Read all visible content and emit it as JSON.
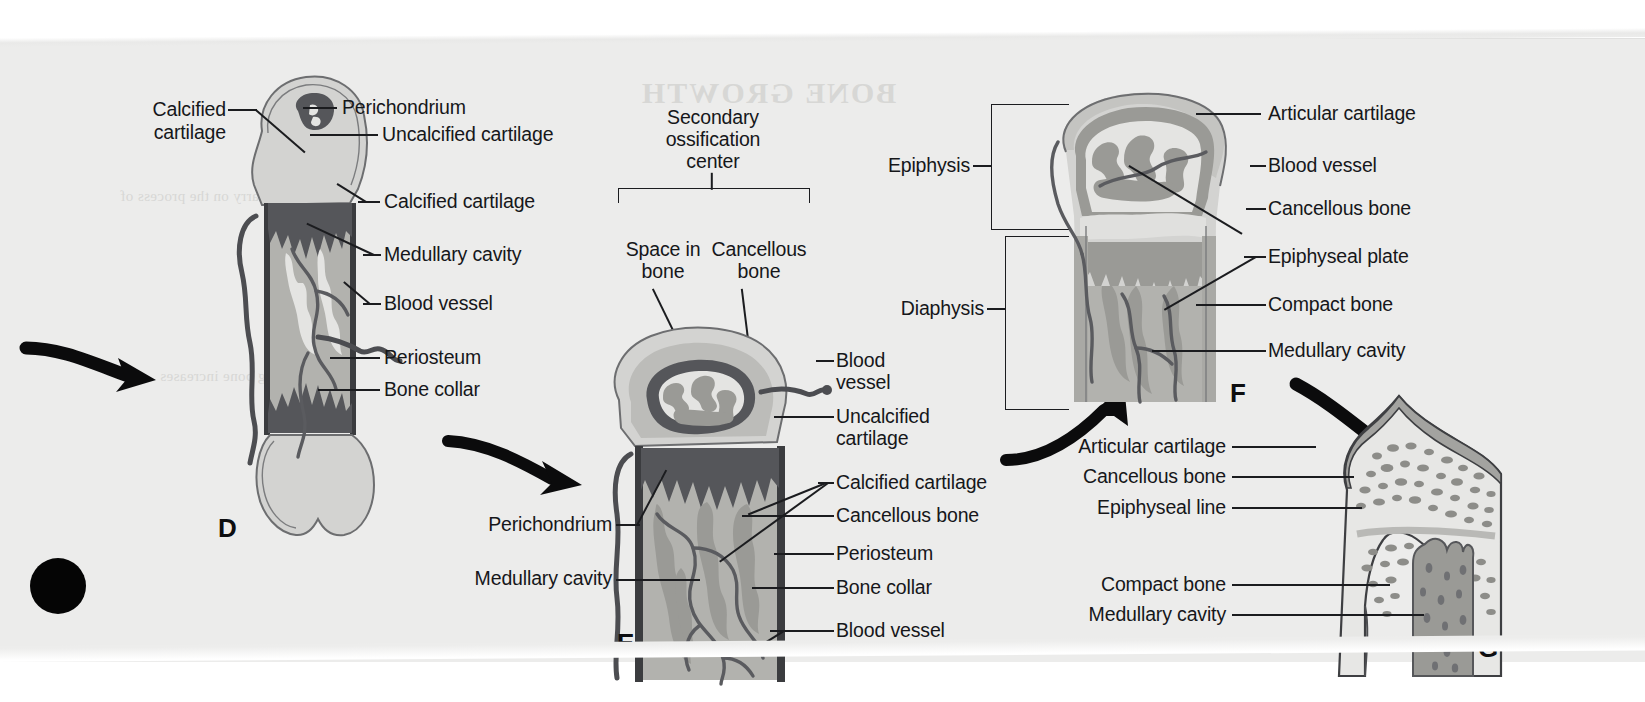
{
  "figure": {
    "background_color": "#ececeb",
    "ink_color": "#16171a"
  },
  "panels": [
    {
      "id": "D",
      "letter": "D",
      "labels": [
        {
          "name": "calcified-cartilage",
          "text": "Calcified\ncartilage"
        },
        {
          "name": "perichondrium",
          "text": "Perichondrium"
        },
        {
          "name": "uncalcified-cartilage",
          "text": "Uncalcified cartilage"
        },
        {
          "name": "calcified-cartilage-2",
          "text": "Calcified cartilage"
        },
        {
          "name": "medullary-cavity",
          "text": "Medullary cavity"
        },
        {
          "name": "blood-vessel",
          "text": "Blood vessel"
        },
        {
          "name": "periosteum",
          "text": "Periosteum"
        },
        {
          "name": "bone-collar",
          "text": "Bone collar"
        }
      ]
    },
    {
      "id": "E",
      "letter": "E",
      "bracket_title": "Secondary\nossification\ncenter",
      "labels": [
        {
          "name": "space-in-bone",
          "text": "Space in\nbone"
        },
        {
          "name": "cancellous-bone-top",
          "text": "Cancellous\nbone"
        },
        {
          "name": "blood-vessel-top",
          "text": "Blood\nvessel"
        },
        {
          "name": "uncalcified-cartilage",
          "text": "Uncalcified\ncartilage"
        },
        {
          "name": "calcified-cartilage",
          "text": "Calcified cartilage"
        },
        {
          "name": "cancellous-bone",
          "text": "Cancellous bone"
        },
        {
          "name": "periosteum",
          "text": "Periosteum"
        },
        {
          "name": "bone-collar",
          "text": "Bone collar"
        },
        {
          "name": "blood-vessel-bottom",
          "text": "Blood vessel"
        },
        {
          "name": "perichondrium",
          "text": "Perichondrium"
        },
        {
          "name": "medullary-cavity",
          "text": "Medullary cavity"
        }
      ]
    },
    {
      "id": "F",
      "letter": "F",
      "labels": [
        {
          "name": "epiphysis",
          "text": "Epiphysis"
        },
        {
          "name": "diaphysis",
          "text": "Diaphysis"
        },
        {
          "name": "articular-cartilage",
          "text": "Articular cartilage"
        },
        {
          "name": "blood-vessel",
          "text": "Blood vessel"
        },
        {
          "name": "cancellous-bone",
          "text": "Cancellous bone"
        },
        {
          "name": "epiphyseal-plate",
          "text": "Epiphyseal plate"
        },
        {
          "name": "compact-bone",
          "text": "Compact bone"
        },
        {
          "name": "medullary-cavity",
          "text": "Medullary cavity"
        }
      ]
    },
    {
      "id": "G",
      "letter": "G",
      "labels": [
        {
          "name": "articular-cartilage",
          "text": "Articular cartilage"
        },
        {
          "name": "cancellous-bone",
          "text": "Cancellous bone"
        },
        {
          "name": "epiphyseal-line",
          "text": "Epiphyseal line"
        },
        {
          "name": "compact-bone",
          "text": "Compact bone"
        },
        {
          "name": "medullary-cavity",
          "text": "Medullary cavity"
        }
      ]
    }
  ],
  "panel_d": {
    "letter": "D",
    "l_calcified_cartilage": "Calcified",
    "l_calcified_cartilage2": "cartilage",
    "l_perichondrium": "Perichondrium",
    "l_uncalcified_cartilage": "Uncalcified cartilage",
    "l_calcified_cartilage_mid": "Calcified cartilage",
    "l_medullary_cavity": "Medullary cavity",
    "l_blood_vessel": "Blood vessel",
    "l_periosteum": "Periosteum",
    "l_bone_collar": "Bone collar"
  },
  "panel_e": {
    "letter": "E",
    "l_secondary1": "Secondary",
    "l_secondary2": "ossification",
    "l_secondary3": "center",
    "l_space_in_bone1": "Space in",
    "l_space_in_bone2": "bone",
    "l_cancellous_top1": "Cancellous",
    "l_cancellous_top2": "bone",
    "l_blood_vessel1": "Blood",
    "l_blood_vessel2": "vessel",
    "l_uncalcified1": "Uncalcified",
    "l_uncalcified2": "cartilage",
    "l_calcified_cartilage": "Calcified cartilage",
    "l_cancellous_bone": "Cancellous bone",
    "l_periosteum": "Periosteum",
    "l_bone_collar": "Bone collar",
    "l_blood_vessel_bottom": "Blood vessel",
    "l_perichondrium": "Perichondrium",
    "l_medullary_cavity": "Medullary cavity"
  },
  "panel_f": {
    "letter": "F",
    "l_epiphysis": "Epiphysis",
    "l_diaphysis": "Diaphysis",
    "l_articular_cartilage": "Articular cartilage",
    "l_blood_vessel": "Blood vessel",
    "l_cancellous_bone": "Cancellous bone",
    "l_epiphyseal_plate": "Epiphyseal plate",
    "l_compact_bone": "Compact bone",
    "l_medullary_cavity": "Medullary cavity"
  },
  "panel_g": {
    "letter": "G",
    "l_articular_cartilage": "Articular cartilage",
    "l_cancellous_bone": "Cancellous bone",
    "l_epiphyseal_line": "Epiphyseal line",
    "l_compact_bone": "Compact bone",
    "l_medullary_cavity": "Medullary cavity"
  },
  "showthrough": {
    "line1": "BONE GROWTH",
    "line2": "carry on the process of",
    "line3": "long bone increases"
  }
}
